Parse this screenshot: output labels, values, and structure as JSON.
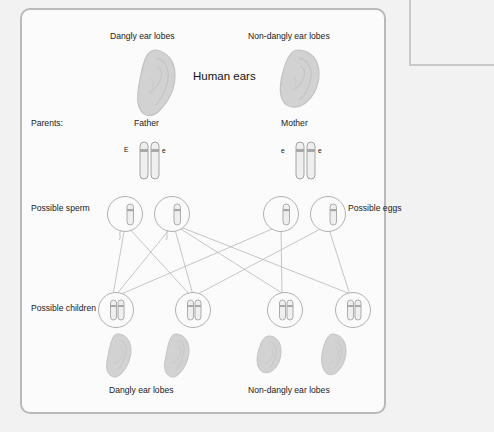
{
  "figure": {
    "title": "Human ears",
    "top_labels": {
      "left": "Dangly ear lobes",
      "right": "Non-dangly ear lobes"
    },
    "row_labels": {
      "parents": "Parents:",
      "sperm": "Possible sperm",
      "eggs": "Possible eggs",
      "children": "Possible children"
    },
    "parents": [
      {
        "name": "Father",
        "phenotype": "Dangly ear lobes",
        "alleles": [
          "E",
          "e"
        ]
      },
      {
        "name": "Mother",
        "phenotype": "Non-dangly ear lobes",
        "alleles": [
          "e",
          "e"
        ]
      }
    ],
    "gametes": {
      "sperm": [
        {
          "allele": "E"
        },
        {
          "allele": "e"
        }
      ],
      "eggs": [
        {
          "allele": "e"
        },
        {
          "allele": "e"
        }
      ]
    },
    "children": [
      {
        "alleles": [
          "E",
          "e"
        ],
        "phenotype": "Dangly ear lobes"
      },
      {
        "alleles": [
          "E",
          "e"
        ],
        "phenotype": "Dangly ear lobes"
      },
      {
        "alleles": [
          "e",
          "e"
        ],
        "phenotype": "Non-dangly ear lobes"
      },
      {
        "alleles": [
          "e",
          "e"
        ],
        "phenotype": "Non-dangly ear lobes"
      }
    ],
    "bottom_labels": {
      "left": "Dangly ear lobes",
      "right": "Non-dangly ear lobes"
    }
  },
  "side_note": {
    "text": "The allele for dangly ear lobes is dominant, which is shown by the capital letter E in the father's chromosomes. However, the father has one recessive allele for non-dangly ear lobes. If this combines with one from the mother, the child will have non-dangly ear lobes."
  },
  "colors": {
    "page_background": "#f2f2f2",
    "panel_background": "#fbfbfb",
    "panel_border": "#b9b9b9",
    "ear_fill": "#d2d2d2",
    "ear_stroke": "#bdbdbd",
    "chromosome_fill": "#efefef",
    "chromosome_stroke": "#9a9a9a",
    "centromere": "#9e9e9e",
    "cell_stroke": "#b0b0b0",
    "line": "#b4b4b4",
    "text": "#1a1a1a"
  }
}
